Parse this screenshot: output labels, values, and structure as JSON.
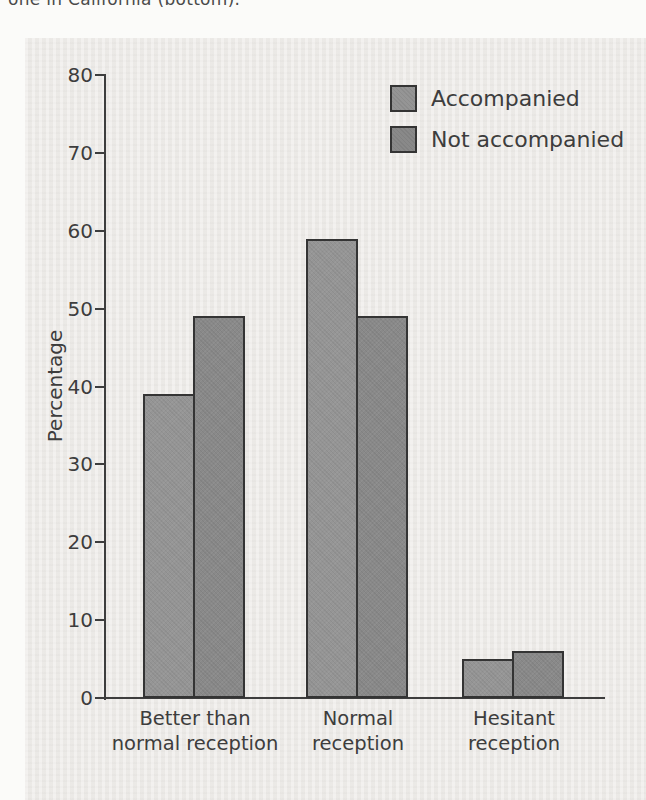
{
  "caption_fragment": "one in California (bottom).",
  "colors": {
    "page_background": "#fbfbf9",
    "panel_background": "#eceae7",
    "ink": "#3d3d3d",
    "bar_border": "#343434",
    "accompanied_fill": "#959595",
    "not_accompanied_fill": "#898989"
  },
  "chart_data": {
    "type": "bar",
    "title": "",
    "xlabel": "",
    "ylabel": "Percentage",
    "categories": [
      [
        "Better than",
        "normal reception"
      ],
      [
        "Normal",
        "reception"
      ],
      [
        "Hesitant",
        "reception"
      ]
    ],
    "series": [
      {
        "name": "Accompanied",
        "values": [
          39,
          59,
          5
        ],
        "color": "#959595"
      },
      {
        "name": "Not accompanied",
        "values": [
          49,
          49,
          6
        ],
        "color": "#898989"
      }
    ],
    "ylim": [
      0,
      80
    ],
    "ytick_step": 10,
    "yticks": [
      0,
      10,
      20,
      30,
      40,
      50,
      60,
      70,
      80
    ],
    "grid": false,
    "legend_position": "top-right"
  }
}
